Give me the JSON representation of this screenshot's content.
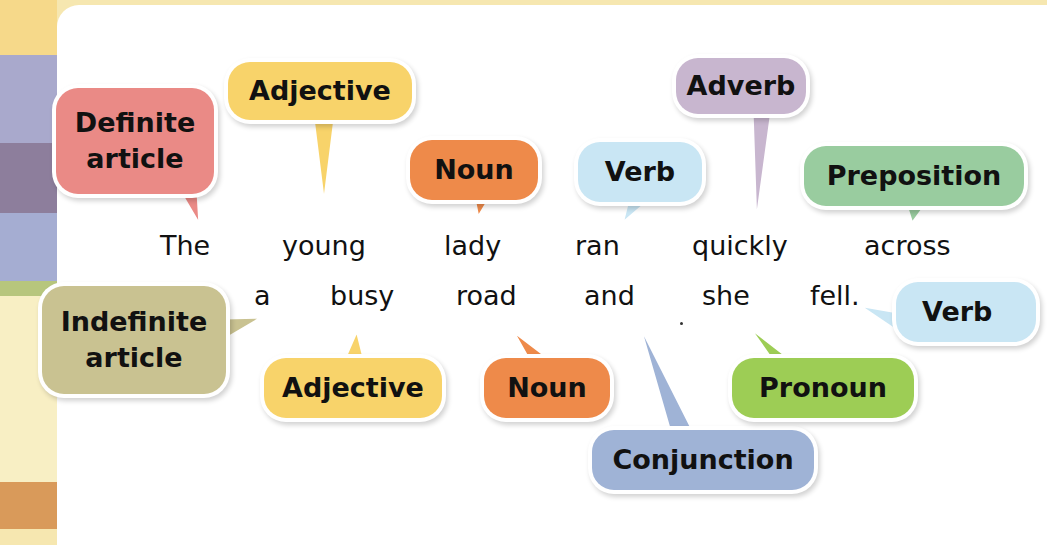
{
  "colors": {
    "definite_article": "#ea8a86",
    "adjective": "#f8d36a",
    "noun": "#ee8a4a",
    "verb": "#c9e6f4",
    "adverb": "#c8b6cf",
    "preposition": "#99cc9f",
    "indefinite_article": "#c9c291",
    "pronoun": "#9dcd55",
    "conjunction": "#9fb3d6",
    "panel": "#ffffff",
    "side_strip": [
      "#f6d98a",
      "#a9a9cc",
      "#8d7e9c",
      "#a5add2",
      "#b7c67d",
      "#f8efc4",
      "#d99a5a"
    ]
  },
  "sentence": {
    "line1": [
      "The",
      "young",
      "lady",
      "ran",
      "quickly",
      "across"
    ],
    "line2": [
      "a",
      "busy",
      "road",
      "and",
      "she",
      "fell."
    ]
  },
  "labels": {
    "definite_article": [
      "Definite",
      "article"
    ],
    "adjective_top": "Adjective",
    "noun_top": "Noun",
    "verb_top": "Verb",
    "adverb": "Adverb",
    "preposition": "Preposition",
    "indefinite_article": [
      "Indefinite",
      "article"
    ],
    "adjective_bottom": "Adjective",
    "noun_bottom": "Noun",
    "conjunction": "Conjunction",
    "pronoun": "Pronoun",
    "verb_right": "Verb"
  }
}
